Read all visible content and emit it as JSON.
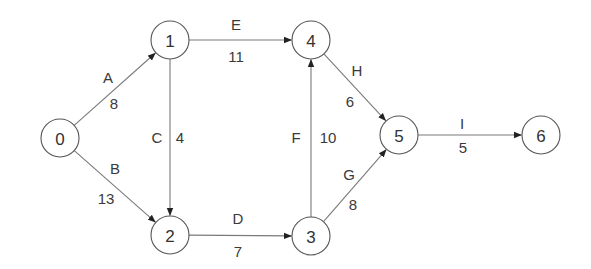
{
  "diagram": {
    "type": "activity-network",
    "node_radius": 19,
    "colors": {
      "line": "#7a7a7a",
      "node_stroke": "#555555",
      "text": "#333333",
      "arrow": "#222222"
    },
    "nodes": [
      {
        "id": "0",
        "label": "0",
        "x": 60,
        "y": 138
      },
      {
        "id": "1",
        "label": "1",
        "x": 170,
        "y": 40
      },
      {
        "id": "2",
        "label": "2",
        "x": 170,
        "y": 235
      },
      {
        "id": "3",
        "label": "3",
        "x": 311,
        "y": 236
      },
      {
        "id": "4",
        "label": "4",
        "x": 311,
        "y": 40
      },
      {
        "id": "5",
        "label": "5",
        "x": 399,
        "y": 135
      },
      {
        "id": "6",
        "label": "6",
        "x": 541,
        "y": 135
      }
    ],
    "edges": [
      {
        "activity": "A",
        "duration": "8",
        "from": "0",
        "to": "1",
        "activity_pos": [
          108,
          77
        ],
        "duration_pos": [
          114,
          103
        ]
      },
      {
        "activity": "B",
        "duration": "13",
        "from": "0",
        "to": "2",
        "activity_pos": [
          115,
          168
        ],
        "duration_pos": [
          106,
          198
        ]
      },
      {
        "activity": "C",
        "duration": "4",
        "from": "1",
        "to": "2",
        "activity_pos": [
          157,
          137
        ],
        "duration_pos": [
          180,
          137
        ]
      },
      {
        "activity": "E",
        "duration": "11",
        "from": "1",
        "to": "4",
        "activity_pos": [
          236,
          24
        ],
        "duration_pos": [
          236,
          56
        ]
      },
      {
        "activity": "D",
        "duration": "7",
        "from": "2",
        "to": "3",
        "activity_pos": [
          238,
          218
        ],
        "duration_pos": [
          238,
          251
        ]
      },
      {
        "activity": "F",
        "duration": "10",
        "from": "3",
        "to": "4",
        "activity_pos": [
          296,
          137
        ],
        "duration_pos": [
          328,
          137
        ]
      },
      {
        "activity": "H",
        "duration": "6",
        "from": "4",
        "to": "5",
        "activity_pos": [
          357,
          70
        ],
        "duration_pos": [
          350,
          101
        ]
      },
      {
        "activity": "G",
        "duration": "8",
        "from": "3",
        "to": "5",
        "activity_pos": [
          349,
          174
        ],
        "duration_pos": [
          353,
          204
        ]
      },
      {
        "activity": "I",
        "duration": "5",
        "from": "5",
        "to": "6",
        "activity_pos": [
          462,
          123
        ],
        "duration_pos": [
          463,
          147
        ]
      }
    ]
  }
}
